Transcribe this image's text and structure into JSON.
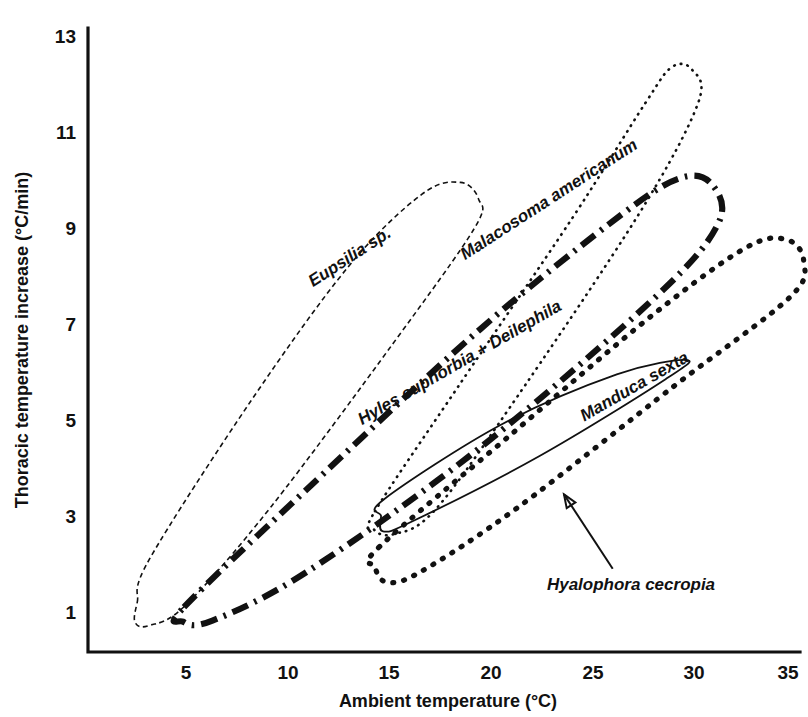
{
  "figure": {
    "background_color": "#ffffff",
    "ink_color": "#111111"
  },
  "chart_data": {
    "type": "line",
    "title": "",
    "subtitle": "",
    "xlabel": "Ambient temperature (°C)",
    "ylabel": "Thoracic temperature increase (°C/min)",
    "xlim": [
      1,
      37
    ],
    "ylim": [
      0.2,
      13.6
    ],
    "xticks": [
      5,
      10,
      15,
      20,
      25,
      30,
      35
    ],
    "xtick_labels": [
      "5",
      "10",
      "15",
      "20",
      "25",
      "30",
      "35"
    ],
    "yticks": [
      1,
      3,
      5,
      7,
      9,
      11,
      13
    ],
    "ytick_labels": [
      "1",
      "3",
      "5",
      "7",
      "9",
      "11",
      "13"
    ],
    "grid": false,
    "legend_position": "inline-annotations",
    "series": [
      {
        "name": "Eupsilia sp.",
        "label": "Eupsilia sp.",
        "line_style": "fine-dashed",
        "x_range": [
          2.5,
          19.5
        ],
        "y_range": [
          0.7,
          9.9
        ],
        "envelope_points": [
          [
            2.6,
            1.2
          ],
          [
            3.2,
            2.1
          ],
          [
            8.2,
            5.4
          ],
          [
            13.0,
            8.2
          ],
          [
            16.6,
            9.7
          ],
          [
            18.5,
            9.95
          ],
          [
            19.4,
            9.6
          ],
          [
            19.2,
            9.0
          ],
          [
            15.2,
            6.6
          ],
          [
            9.2,
            3.2
          ],
          [
            5.0,
            1.15
          ],
          [
            3.2,
            0.72
          ],
          [
            2.5,
            0.78
          ]
        ],
        "label_anchor": [
          13.2,
          8.3
        ],
        "label_rotation": -33
      },
      {
        "name": "Malacosoma americanum",
        "label": "Malacosoma americanum",
        "line_style": "fine-dotted",
        "x_range": [
          14.2,
          30.3
        ],
        "y_range": [
          2.6,
          12.4
        ],
        "envelope_points": [
          [
            14.3,
            3.1
          ],
          [
            18.4,
            5.7
          ],
          [
            24.0,
            9.2
          ],
          [
            27.6,
            11.6
          ],
          [
            28.9,
            12.35
          ],
          [
            29.9,
            12.3
          ],
          [
            30.2,
            11.6
          ],
          [
            27.3,
            9.3
          ],
          [
            21.0,
            5.3
          ],
          [
            17.2,
            3.1
          ],
          [
            15.2,
            2.62
          ],
          [
            14.25,
            2.72
          ]
        ],
        "label_anchor": [
          23.0,
          9.5
        ],
        "label_rotation": -33
      },
      {
        "name": "Hyles euphorbia + Deilephila",
        "label": "Hyles euphorbia + Deilephila",
        "line_style": "thick-dash-dot",
        "x_range": [
          4.8,
          31.2
        ],
        "y_range": [
          0.75,
          10.1
        ],
        "envelope_points": [
          [
            4.9,
            1.1
          ],
          [
            10.8,
            3.5
          ],
          [
            19.5,
            6.9
          ],
          [
            26.5,
            9.3
          ],
          [
            29.4,
            10.05
          ],
          [
            30.9,
            9.9
          ],
          [
            31.2,
            9.1
          ],
          [
            28.2,
            7.6
          ],
          [
            19.4,
            4.4
          ],
          [
            11.0,
            1.85
          ],
          [
            6.3,
            0.82
          ],
          [
            4.85,
            0.8
          ]
        ],
        "label_anchor": [
          18.6,
          6.1
        ],
        "label_rotation": -30
      },
      {
        "name": "Manduca sexta",
        "label": "Manduca sexta",
        "line_style": "coarse-dotted",
        "x_range": [
          14.3,
          35.5
        ],
        "y_range": [
          1.6,
          8.8
        ],
        "envelope_points": [
          [
            14.5,
            2.35
          ],
          [
            21.0,
            4.7
          ],
          [
            28.0,
            7.2
          ],
          [
            32.6,
            8.6
          ],
          [
            34.6,
            8.75
          ],
          [
            35.4,
            8.3
          ],
          [
            34.7,
            7.55
          ],
          [
            29.0,
            5.7
          ],
          [
            21.4,
            3.2
          ],
          [
            16.6,
            1.85
          ],
          [
            14.9,
            1.62
          ],
          [
            14.3,
            1.95
          ]
        ],
        "label_anchor": [
          27.2,
          5.6
        ],
        "label_rotation": -30
      },
      {
        "name": "Hyalophora cecropia",
        "label": "Hyalophora cecropia",
        "line_style": "thin-solid",
        "x_range": [
          14.6,
          29.8
        ],
        "y_range": [
          2.65,
          6.25
        ],
        "envelope_points": [
          [
            14.75,
            3.35
          ],
          [
            20.5,
            4.9
          ],
          [
            26.2,
            5.95
          ],
          [
            29.6,
            6.25
          ],
          [
            28.6,
            5.85
          ],
          [
            22.4,
            4.25
          ],
          [
            16.2,
            2.9
          ],
          [
            14.7,
            2.68
          ],
          [
            14.6,
            3.0
          ]
        ],
        "label_anchor": [
          26.9,
          1.45
        ],
        "label_rotation": 0,
        "has_leader_arrow": true,
        "leader_from": [
          26.0,
          1.9
        ],
        "leader_to": [
          23.6,
          3.45
        ]
      }
    ]
  }
}
